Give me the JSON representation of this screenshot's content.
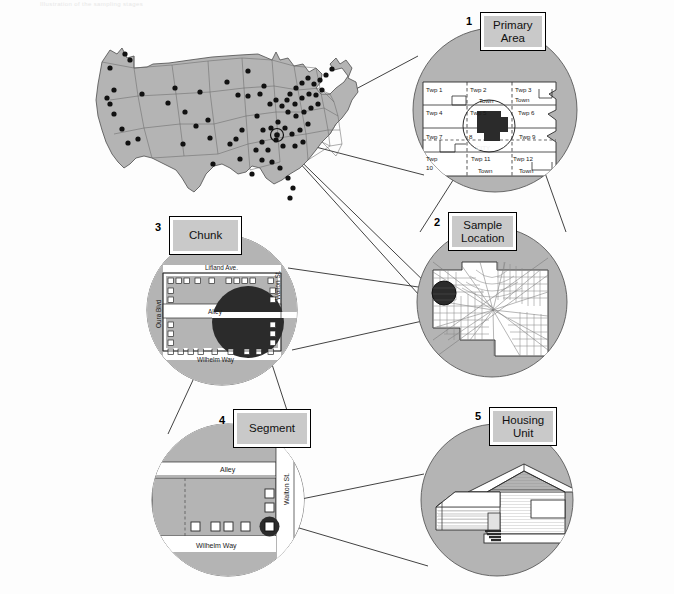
{
  "figure": {
    "top_note": "Illustration of the sampling stages",
    "background_color": "#fdfdfd",
    "circle_fill": "#b4b4b4",
    "map_fill": "#b4b4b4",
    "dark_fill": "#2b2b2b",
    "white_fill": "#ffffff"
  },
  "callouts": [
    {
      "number": "1",
      "label": "Primary\nArea"
    },
    {
      "number": "2",
      "label": "Sample\nLocation"
    },
    {
      "number": "3",
      "label": "Chunk"
    },
    {
      "number": "4",
      "label": "Segment"
    },
    {
      "number": "5",
      "label": "Housing\nUnit"
    }
  ],
  "primary_area": {
    "townships": [
      "Twp 1",
      "Twp 2",
      "Twp 3",
      "Twp 4",
      "Twp 5",
      "Twp 6",
      "Twp 7",
      "8",
      "Twp 9",
      "Twp\n10",
      "Twp 11",
      "Twp 12"
    ],
    "town_labels": [
      "Town",
      "Town",
      "Town",
      "Town"
    ],
    "city_label": "CITY"
  },
  "chunk": {
    "streets": {
      "top": "Lifland Ave.",
      "middle": "Alley",
      "bottom": "Wilhelm Way",
      "left": "Oura Blvd",
      "right": "Walton St."
    }
  },
  "segment": {
    "streets": {
      "top": "Alley",
      "bottom": "Wilhelm Way",
      "right": "Walton St."
    }
  },
  "us_map": {
    "sample_points_count": 76,
    "highlighted_point_label": ""
  }
}
